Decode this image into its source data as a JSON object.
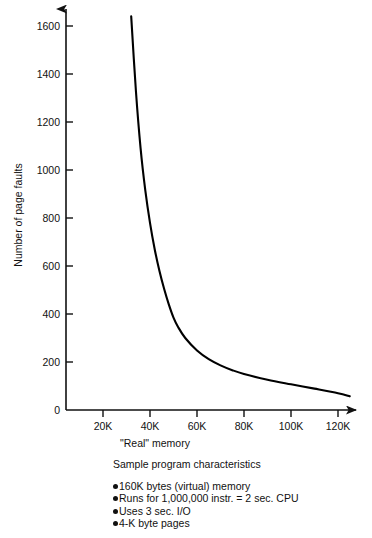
{
  "chart_data": {
    "type": "line",
    "title": "",
    "xlabel": "\"Real\" memory",
    "ylabel": "Number of page faults",
    "xlim": [
      0,
      132000
    ],
    "ylim": [
      0,
      1700
    ],
    "grid": false,
    "legend": "none",
    "x_tick_labels": [
      "20K",
      "40K",
      "60K",
      "80K",
      "100K",
      "120K"
    ],
    "x_tick_values": [
      20000,
      40000,
      60000,
      80000,
      100000,
      120000
    ],
    "y_tick_labels": [
      "0",
      "200",
      "400",
      "600",
      "800",
      "1000",
      "1200",
      "1400",
      "1600"
    ],
    "y_tick_values": [
      0,
      200,
      400,
      600,
      800,
      1000,
      1200,
      1400,
      1600
    ],
    "series": [
      {
        "name": "page faults vs real memory",
        "color": "#000000",
        "x": [
          32000,
          34000,
          36000,
          38000,
          40000,
          42000,
          44000,
          46000,
          48000,
          50000,
          52000,
          55000,
          60000,
          65000,
          70000,
          75000,
          80000,
          90000,
          100000,
          110000,
          120000,
          125000
        ],
        "values": [
          1640,
          1330,
          1090,
          915,
          780,
          670,
          580,
          505,
          440,
          385,
          345,
          300,
          248,
          212,
          186,
          166,
          150,
          126,
          107,
          89,
          70,
          57
        ]
      }
    ]
  },
  "axes": {
    "y_axis_label": "Number of page faults",
    "x_axis_label": "\"Real\" memory",
    "x_ticks": [
      "20K",
      "40K",
      "60K",
      "80K",
      "100K",
      "120K"
    ],
    "y_ticks": [
      "1600",
      "1400",
      "1200",
      "1000",
      "800",
      "600",
      "400",
      "200",
      "0"
    ]
  },
  "caption": {
    "heading": "Sample program characteristics",
    "bullets": [
      "160K bytes (virtual) memory",
      "Runs for 1,000,000 instr. = 2 sec. CPU",
      "Uses 3 sec. I/O",
      "4-K byte pages"
    ]
  },
  "colors": {
    "curve": "#000000",
    "axis": "#111111",
    "background": "#ffffff",
    "text": "#111111"
  }
}
